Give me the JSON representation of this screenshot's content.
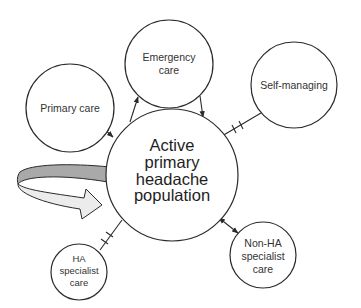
{
  "diagram": {
    "colors": {
      "stroke": "#2a2a2a",
      "text": "#333333",
      "arrow_dark": "#a9a9a9",
      "arrow_light": "#ececec"
    },
    "center": {
      "lines": [
        "Active",
        "primary",
        "headache",
        "population"
      ]
    },
    "nodes": {
      "primary_care": {
        "lines": [
          "Primary care"
        ]
      },
      "emergency_care": {
        "lines": [
          "Emergency",
          "care"
        ]
      },
      "self_managing": {
        "lines": [
          "Self-managing"
        ]
      },
      "ha_specialist": {
        "lines": [
          "HA",
          "specialist",
          "care"
        ]
      },
      "non_ha_specialist": {
        "lines": [
          "Non-HA",
          "specialist",
          "care"
        ]
      }
    },
    "connections": [
      {
        "from": "primary_care",
        "to": "center",
        "type": "bidirectional-arrow"
      },
      {
        "from": "center",
        "to": "emergency_care",
        "type": "arrow"
      },
      {
        "from": "emergency_care",
        "to": "center",
        "type": "arrow"
      },
      {
        "from": "center",
        "to": "self_managing",
        "type": "blocked-line"
      },
      {
        "from": "center",
        "to": "ha_specialist",
        "type": "blocked-line"
      },
      {
        "from": "center",
        "to": "non_ha_specialist",
        "type": "bidirectional-arrow"
      }
    ],
    "inflow_arrow": {
      "type": "curved-arrow",
      "target": "center"
    }
  }
}
